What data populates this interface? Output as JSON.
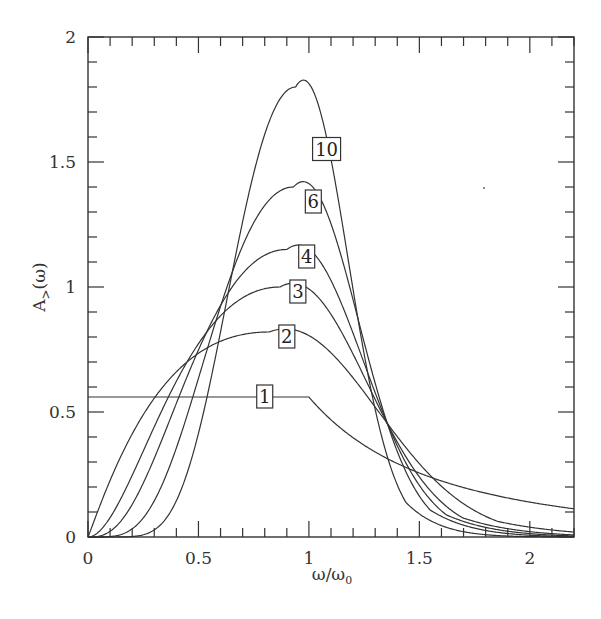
{
  "chart_data": {
    "type": "line",
    "title": "",
    "xlabel": "ω/ω₀",
    "ylabel": "A>(ω)",
    "xlim": [
      0,
      2.2
    ],
    "ylim": [
      0,
      2
    ],
    "grid": false,
    "legend": "inline boxed labels on curves",
    "x_ticks": [
      0,
      0.5,
      1,
      1.5,
      2
    ],
    "x_tick_labels": [
      "0",
      "0.5",
      "1",
      "1.5",
      "2"
    ],
    "y_ticks": [
      0,
      0.5,
      1,
      1.5,
      2
    ],
    "y_tick_labels": [
      "0",
      "0.5",
      "1",
      "1.5",
      "2"
    ],
    "x_minor_step": 0.1,
    "y_minor_step": 0.1,
    "series": [
      {
        "name": "1",
        "peak_x": 1.0,
        "peak_y": 0.56,
        "label_pos": [
          0.8,
          0.56
        ],
        "x": [
          0,
          0.2,
          0.4,
          0.6,
          0.8,
          1.0,
          1.2,
          1.4,
          1.6,
          1.8,
          2.0,
          2.2
        ],
        "y": [
          0.56,
          0.56,
          0.56,
          0.56,
          0.56,
          0.56,
          0.46,
          0.38,
          0.31,
          0.25,
          0.2,
          0.16
        ]
      },
      {
        "name": "2",
        "peak_x": 0.82,
        "peak_y": 0.82,
        "label_pos": [
          0.9,
          0.8
        ],
        "x": [
          0,
          0.2,
          0.4,
          0.6,
          0.8,
          1.0,
          1.2,
          1.4,
          1.6,
          1.8,
          2.0,
          2.2
        ],
        "y": [
          0,
          0.21,
          0.42,
          0.64,
          0.82,
          0.79,
          0.62,
          0.44,
          0.3,
          0.2,
          0.13,
          0.09
        ]
      },
      {
        "name": "3",
        "peak_x": 0.87,
        "peak_y": 1.0,
        "label_pos": [
          0.95,
          0.98
        ],
        "x": [
          0,
          0.2,
          0.4,
          0.6,
          0.8,
          1.0,
          1.2,
          1.4,
          1.6,
          1.8,
          2.0,
          2.2
        ],
        "y": [
          0,
          0.05,
          0.22,
          0.58,
          0.95,
          0.95,
          0.68,
          0.42,
          0.24,
          0.13,
          0.07,
          0.04
        ]
      },
      {
        "name": "4",
        "peak_x": 0.9,
        "peak_y": 1.15,
        "label_pos": [
          0.99,
          1.12
        ],
        "x": [
          0,
          0.2,
          0.4,
          0.6,
          0.8,
          1.0,
          1.2,
          1.4,
          1.6,
          1.8,
          2.0,
          2.2
        ],
        "y": [
          0,
          0.01,
          0.12,
          0.52,
          1.06,
          1.1,
          0.72,
          0.38,
          0.18,
          0.08,
          0.04,
          0.02
        ]
      },
      {
        "name": "6",
        "peak_x": 0.93,
        "peak_y": 1.4,
        "label_pos": [
          1.02,
          1.34
        ],
        "x": [
          0,
          0.2,
          0.4,
          0.6,
          0.8,
          1.0,
          1.2,
          1.4,
          1.6,
          1.8,
          2.0,
          2.2
        ],
        "y": [
          0,
          0.0,
          0.05,
          0.45,
          1.23,
          1.36,
          0.78,
          0.33,
          0.11,
          0.03,
          0.01,
          0.0
        ]
      },
      {
        "name": "10",
        "peak_x": 0.94,
        "peak_y": 1.8,
        "label_pos": [
          1.08,
          1.55
        ],
        "x": [
          0,
          0.2,
          0.4,
          0.6,
          0.8,
          1.0,
          1.2,
          1.4,
          1.6,
          1.8,
          2.0,
          2.2
        ],
        "y": [
          0,
          0.0,
          0.01,
          0.35,
          1.45,
          1.76,
          0.9,
          0.22,
          0.03,
          0.0,
          0.0,
          0.0
        ]
      }
    ]
  }
}
